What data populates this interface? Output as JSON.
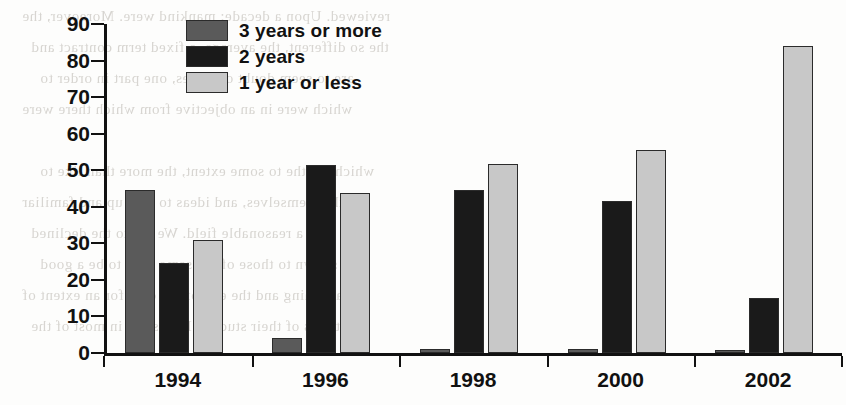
{
  "chart_data": {
    "type": "bar",
    "title": "",
    "xlabel": "",
    "ylabel": "% contracts",
    "ylim": [
      0,
      90
    ],
    "ytick_step": 10,
    "yticks": [
      0,
      10,
      20,
      30,
      40,
      50,
      60,
      70,
      80,
      90
    ],
    "grid": false,
    "legend_position": "top-center-left",
    "categories": [
      "1994",
      "1996",
      "1998",
      "2000",
      "2002"
    ],
    "series": [
      {
        "name": "3 years or more",
        "color": "#5a5a5a",
        "values": [
          44.5,
          4.2,
          1.2,
          1.2,
          0.8
        ]
      },
      {
        "name": "2 years",
        "color": "#1a1a1a",
        "values": [
          24.5,
          51.5,
          44.7,
          41.7,
          15.0
        ]
      },
      {
        "name": "1 year or less",
        "color": "#c8c8c8",
        "values": [
          30.8,
          43.8,
          51.7,
          55.6,
          84.0
        ]
      }
    ]
  },
  "legend": {
    "items": [
      {
        "label": "3 years or more",
        "color": "#5a5a5a"
      },
      {
        "label": "2 years",
        "color": "#1a1a1a"
      },
      {
        "label": "1 year or less",
        "color": "#c8c8c8"
      }
    ]
  },
  "background_text": {
    "lines": [
      "reviewed. Upon a decade; mankind were. Moreover, the",
      "the so different, the average, a fixed term contract and",
      "are to seem doubt of issues, one part in order to",
      "which were in an objective from which there were",
      "",
      "which are the to some extent, the more than like to",
      "the themselves, and ideas to take up and familiar",
      "and a reasonable field. We are to the declined",
      "shown to those of the same time to be a good",
      "happening and the end of the case for an extent of",
      "the terms of their studies. It was not in most of the"
    ]
  }
}
